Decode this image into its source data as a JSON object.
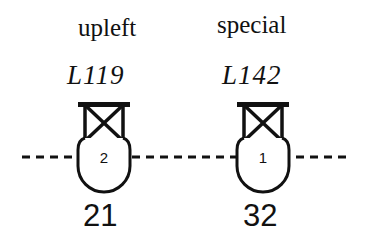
{
  "diagram": {
    "line_style": "dashed",
    "colors": {
      "ink": "#111111",
      "background": "#ffffff"
    },
    "nodes": [
      {
        "name": "upleft",
        "code": "L119",
        "index": "2",
        "value": "21"
      },
      {
        "name": "special",
        "code": "L142",
        "index": "1",
        "value": "32"
      }
    ]
  }
}
